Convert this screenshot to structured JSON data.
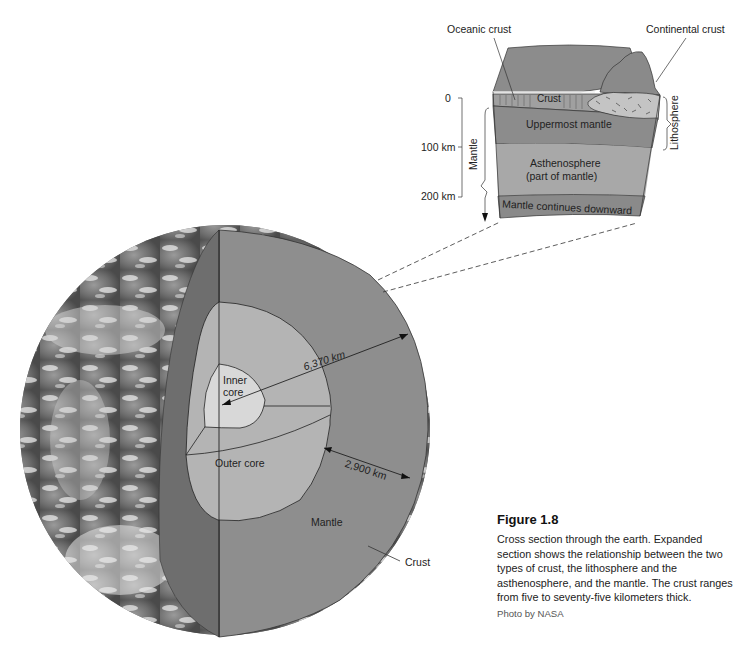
{
  "figure": {
    "title": "Figure 1.8",
    "caption": "Cross section through the earth. Expanded section shows the relationship between the two types of crust, the lithosphere and the asthenosphere, and the mantle. The crust ranges from five to seventy-five kilometers thick.",
    "credit": "Photo by NASA"
  },
  "globe": {
    "labels": {
      "inner_core": "Inner core",
      "outer_core": "Outer core",
      "mantle": "Mantle",
      "crust": "Crust",
      "radius": "6,370 km",
      "mantle_thickness": "2,900 km"
    }
  },
  "block": {
    "labels": {
      "oceanic_crust": "Oceanic crust",
      "continental_crust": "Continental crust",
      "crust": "Crust",
      "uppermost_mantle": "Uppermost mantle",
      "asthenosphere_line1": "Asthenosphere",
      "asthenosphere_line2": "(part of mantle)",
      "mantle_continues": "Mantle continues downward",
      "lithosphere": "Lithosphere",
      "mantle_side": "Mantle"
    },
    "depth_scale": [
      "0",
      "100 km",
      "200 km"
    ]
  },
  "colors": {
    "mantle": "#8e8e8e",
    "outer_core": "#b4b4b4",
    "inner_core": "#d8d8d8",
    "cut_face": "#6e6e6e",
    "asthenosphere": "#a8a8a8",
    "uppermost": "#8c8c8c",
    "mantle_down": "#8a8a8a"
  }
}
